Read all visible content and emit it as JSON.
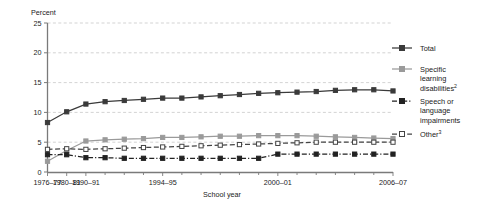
{
  "chart_data": {
    "type": "line",
    "title": "",
    "xlabel": "School year",
    "ylabel": "Percent",
    "ylim": [
      0,
      25
    ],
    "yticks": [
      0,
      5,
      10,
      15,
      20,
      25
    ],
    "ytick_labels": [
      "0",
      "5",
      "10",
      "15",
      "20",
      "25"
    ],
    "grid": "horizontal-dashed",
    "legend_position": "right",
    "x": [
      "1976-77",
      "1980-81",
      "1990-91",
      "1991-92",
      "1992-93",
      "1993-94",
      "1994-95",
      "1995-96",
      "1996-97",
      "1997-98",
      "1998-99",
      "1999-2000",
      "2000-01",
      "2001-02",
      "2002-03",
      "2003-04",
      "2004-05",
      "2005-06",
      "2006-07"
    ],
    "xtick_labels": [
      "1976-77",
      "1980-81",
      "1990-91",
      "1994-95",
      "2000-01",
      "2006-07"
    ],
    "xtick_positions": [
      0,
      1,
      2,
      6,
      12,
      18
    ],
    "series": [
      {
        "name": "Total",
        "color": "#3a3a3a",
        "marker": "filled-square",
        "line_style": "solid",
        "values": [
          8.3,
          10.1,
          11.4,
          11.8,
          12.0,
          12.2,
          12.4,
          12.4,
          12.6,
          12.8,
          13.0,
          13.2,
          13.3,
          13.4,
          13.5,
          13.7,
          13.8,
          13.8,
          13.6
        ]
      },
      {
        "name": "Specific learning disabilities",
        "footnote": "2",
        "color": "#9a9a9a",
        "marker": "filled-square",
        "line_style": "solid",
        "values": [
          1.8,
          3.6,
          5.2,
          5.4,
          5.5,
          5.6,
          5.8,
          5.8,
          5.9,
          6.0,
          6.0,
          6.1,
          6.1,
          6.1,
          6.0,
          5.9,
          5.8,
          5.7,
          5.6
        ]
      },
      {
        "name": "Speech or language impairments",
        "color": "#222222",
        "marker": "filled-square",
        "line_style": "dash-dot",
        "values": [
          2.9,
          2.9,
          2.4,
          2.4,
          2.3,
          2.3,
          2.3,
          2.3,
          2.3,
          2.3,
          2.3,
          2.3,
          3.0,
          3.0,
          3.0,
          3.0,
          3.0,
          3.0,
          3.0
        ]
      },
      {
        "name": "Other",
        "footnote": "3",
        "color": "#444444",
        "marker": "open-square",
        "line_style": "dashed",
        "values": [
          3.8,
          3.9,
          3.8,
          3.9,
          4.0,
          4.1,
          4.2,
          4.3,
          4.4,
          4.5,
          4.6,
          4.7,
          4.8,
          4.9,
          5.0,
          5.0,
          5.0,
          5.0,
          5.0
        ]
      }
    ]
  },
  "legend": {
    "entries": [
      {
        "label": "Total",
        "sup": "",
        "line2": "",
        "line3": ""
      },
      {
        "label": "Specific",
        "sup": "",
        "line2": "learning",
        "line3": "disabilities",
        "line3_sup": "2"
      },
      {
        "label": "Speech or",
        "sup": "",
        "line2": "language",
        "line3": "impairments"
      },
      {
        "label": "Other",
        "sup": "3",
        "line2": "",
        "line3": ""
      }
    ]
  }
}
